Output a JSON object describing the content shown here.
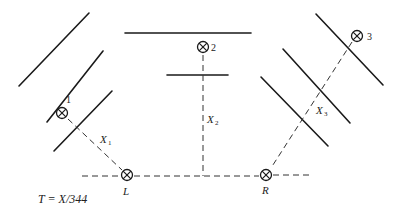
{
  "diagram": {
    "sources": [
      {
        "id": "source-1",
        "label": "1"
      },
      {
        "id": "source-2",
        "label": "2"
      },
      {
        "id": "source-3",
        "label": "3"
      }
    ],
    "listeners": [
      {
        "id": "listener-L",
        "label": "L"
      },
      {
        "id": "listener-R",
        "label": "R"
      }
    ],
    "distances": [
      {
        "id": "x1",
        "base": "X",
        "sub": "1"
      },
      {
        "id": "x2",
        "base": "X",
        "sub": "2"
      },
      {
        "id": "x3",
        "base": "X",
        "sub": "3"
      }
    ],
    "formula": "T = X/344",
    "icon": "circled-cross-icon"
  }
}
